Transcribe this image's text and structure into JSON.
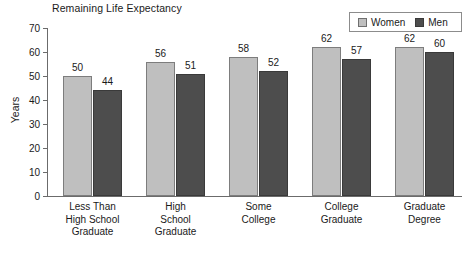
{
  "chart_data": {
    "type": "bar",
    "title": "Remaining Life Expectancy",
    "xlabel": "",
    "ylabel": "Years",
    "ylim": [
      0,
      70
    ],
    "yticks": [
      0,
      10,
      20,
      30,
      40,
      50,
      60,
      70
    ],
    "grid": false,
    "legend_position": "top-right",
    "categories": [
      "Less Than\nHigh School\nGraduate",
      "High\nSchool\nGraduate",
      "Some\nCollege",
      "College\nGraduate",
      "Graduate\nDegree"
    ],
    "category_lines": [
      [
        "Less Than",
        "High School",
        "Graduate"
      ],
      [
        "High",
        "School",
        "Graduate"
      ],
      [
        "Some",
        "College"
      ],
      [
        "College",
        "Graduate"
      ],
      [
        "Graduate",
        "Degree"
      ]
    ],
    "series": [
      {
        "name": "Women",
        "color": "#bfbfbf",
        "values": [
          50,
          56,
          58,
          62,
          62
        ]
      },
      {
        "name": "Men",
        "color": "#4d4d4d",
        "values": [
          44,
          51,
          52,
          57,
          60
        ]
      }
    ]
  },
  "legend": {
    "items": [
      {
        "label": "Women",
        "color": "#bfbfbf"
      },
      {
        "label": "Men",
        "color": "#4d4d4d"
      }
    ]
  },
  "axis": {
    "y_title": "Years",
    "y_tick_labels": [
      "70",
      "60",
      "50",
      "40",
      "30",
      "20",
      "10",
      "0"
    ]
  }
}
